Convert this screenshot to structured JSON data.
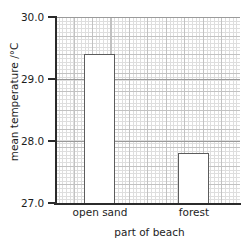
{
  "chart_data": {
    "type": "bar",
    "title": "",
    "xlabel": "part of beach",
    "ylabel": "mean temperature /°C",
    "categories": [
      "open sand",
      "forest"
    ],
    "values": [
      29.4,
      27.8
    ],
    "ylim": [
      27.0,
      30.0
    ],
    "ytick_labels": [
      "27.0",
      "28.0",
      "29.0",
      "30.0"
    ],
    "ytick_values": [
      27.0,
      28.0,
      29.0,
      30.0
    ],
    "grid": true,
    "grid_style": "graph-paper, 5 minor divisions per major",
    "legend": "none",
    "bar_fill": "#ffffff",
    "bar_outline": "#5c5c5c",
    "axis_color": "#2b2b2b",
    "grid_major_color": "#c2c2c2",
    "grid_minor_color": "#dedede",
    "background": "#ffffff"
  },
  "axes": {
    "y_title": "mean temperature /°C",
    "x_title": "part of beach",
    "y_labels": [
      "30.0",
      "29.0",
      "28.0",
      "27.0"
    ],
    "x_labels": [
      "open sand",
      "forest"
    ]
  }
}
